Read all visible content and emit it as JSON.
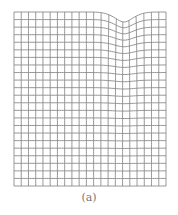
{
  "figure": {
    "caption": "(a)",
    "grid": {
      "columns": 21,
      "rows": 23,
      "left": 14,
      "right": 166,
      "top": 12,
      "bottom": 186,
      "line_color": "#8a8a8a"
    },
    "deformation": {
      "center_x": 124,
      "depth": 10,
      "width_sigma": 14,
      "decay_rows": 5
    }
  }
}
